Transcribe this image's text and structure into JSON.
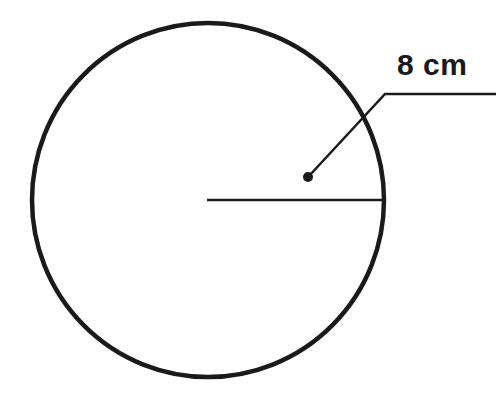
{
  "figure": {
    "name": "circle-with-radius-dimension",
    "background_color": "#ffffff",
    "stroke_color": "#1a1a1a",
    "width": 496,
    "height": 399
  },
  "circle": {
    "name": "circle-outline",
    "center_x": 208,
    "center_y": 200,
    "radius_x": 176,
    "radius_y": 177,
    "stroke_width": 4.5,
    "fill": "none"
  },
  "radius_line": {
    "name": "radius-segment",
    "x1": 207,
    "y1": 200,
    "x2": 383,
    "y2": 200,
    "stroke_width": 2.5
  },
  "leader": {
    "name": "leader-line",
    "horizontal": {
      "x1": 496,
      "y1": 94,
      "x2": 385,
      "y2": 94
    },
    "diagonal": {
      "x1": 385,
      "y1": 94,
      "x2": 309,
      "y2": 176
    },
    "stroke_width": 2.5
  },
  "pointer_dot": {
    "name": "leader-endpoint-dot",
    "cx": 308,
    "cy": 177,
    "r": 5
  },
  "labels": {
    "measurement": "8 cm"
  }
}
